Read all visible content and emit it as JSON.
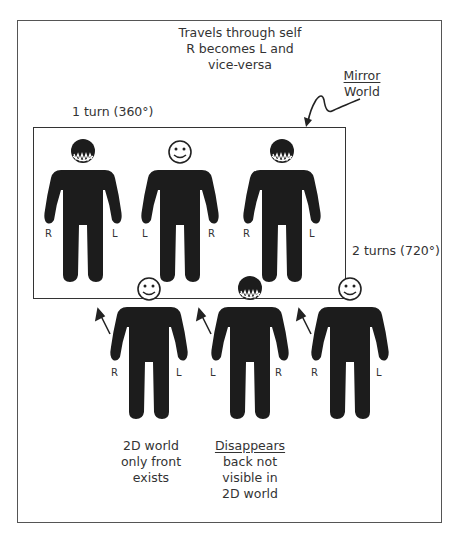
{
  "title_lines": [
    "Travels through self",
    "R becomes L and",
    "vice-versa"
  ],
  "mirror_label": {
    "line1": "Mirror",
    "line2": "World"
  },
  "one_turn_label": "1 turn (360°)",
  "two_turns_label": "2 turns (720°)",
  "top_row": [
    {
      "head": "back",
      "left_label": "R",
      "right_label": "L"
    },
    {
      "head": "face",
      "left_label": "L",
      "right_label": "R"
    },
    {
      "head": "back",
      "left_label": "R",
      "right_label": "L"
    }
  ],
  "bottom_row": [
    {
      "head": "face",
      "left_label": "R",
      "right_label": "L"
    },
    {
      "head": "back",
      "left_label": "L",
      "right_label": "R"
    },
    {
      "head": "face",
      "left_label": "R",
      "right_label": "L"
    }
  ],
  "caption_left": [
    "2D world",
    "only front",
    "exists"
  ],
  "caption_right": {
    "heading": "Disappears",
    "lines": [
      "back not",
      "visible in",
      "2D world"
    ]
  }
}
